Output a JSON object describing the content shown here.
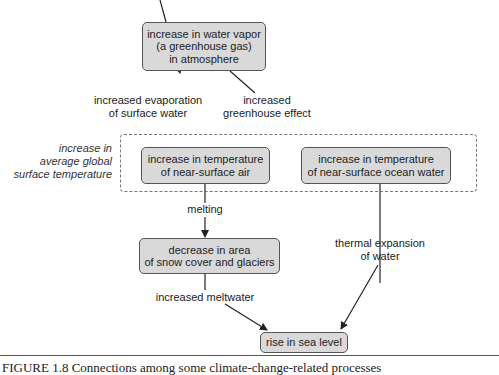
{
  "nodes": {
    "water_vapor": [
      "increase in water vapor",
      "(a greenhouse gas)",
      "in atmosphere"
    ],
    "air_temp": [
      "increase in temperature",
      "of near-surface air"
    ],
    "ocean_temp": [
      "increase in temperature",
      "of near-surface ocean water"
    ],
    "snow_cover": [
      "decrease in area",
      "of snow cover and glaciers"
    ],
    "sea_level": [
      "rise in sea level"
    ]
  },
  "edges": {
    "evaporation": [
      "increased evaporation",
      "of surface water"
    ],
    "greenhouse": [
      "increased",
      "greenhouse effect"
    ],
    "melting": [
      "melting"
    ],
    "thermal": [
      "thermal expansion",
      "of water"
    ],
    "meltwater": [
      "increased meltwater"
    ]
  },
  "region_label": [
    "increase in",
    "average global",
    "surface temperature"
  ],
  "caption": "FIGURE 1.8   Connections among some climate-change-related processes"
}
